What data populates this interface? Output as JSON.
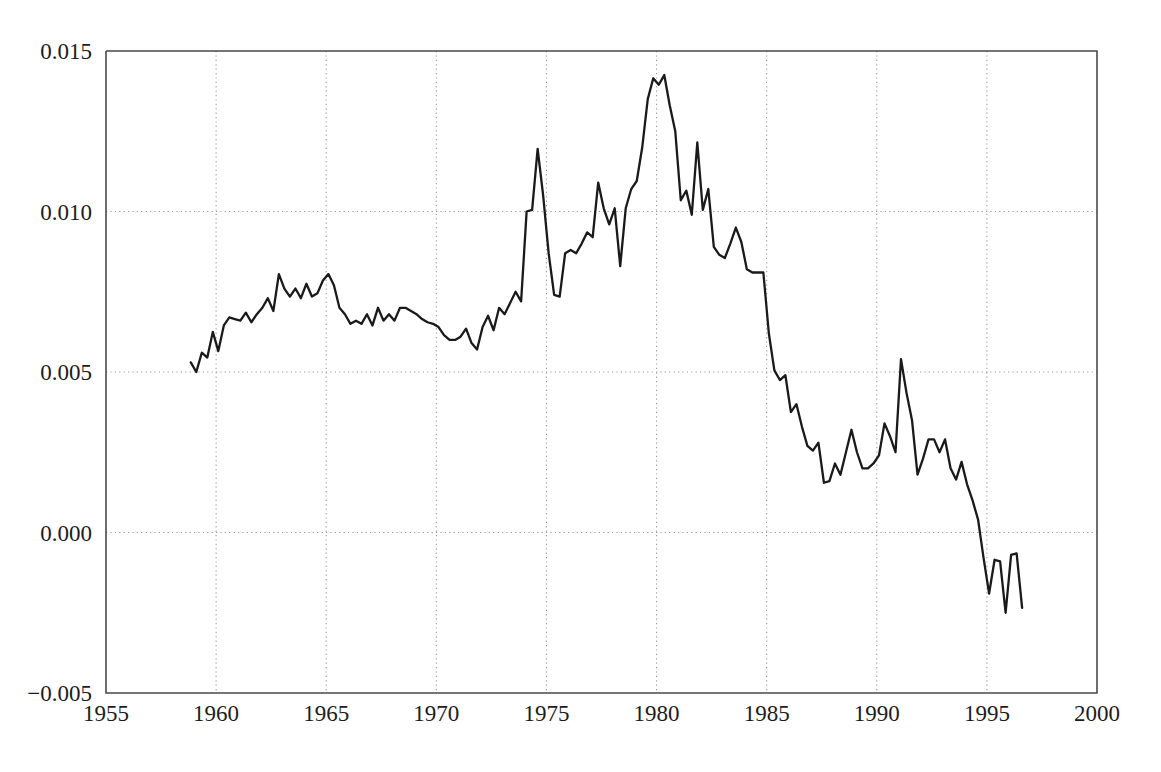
{
  "chart_data": {
    "type": "line",
    "title": "",
    "subtitle": "",
    "xlabel": "",
    "ylabel": "",
    "xlim": [
      1955,
      2000
    ],
    "ylim": [
      -0.005,
      0.015
    ],
    "xticks": [
      1955,
      1960,
      1965,
      1970,
      1975,
      1980,
      1985,
      1990,
      1995,
      2000
    ],
    "xtick_labels": [
      "1955",
      "1960",
      "1965",
      "1970",
      "1975",
      "1980",
      "1985",
      "1990",
      "1995",
      "2000"
    ],
    "yticks": [
      -0.005,
      0.0,
      0.005,
      0.01,
      0.015
    ],
    "ytick_labels": [
      "-0.005",
      "0.000",
      "0.005",
      "0.010",
      "0.015"
    ],
    "grid": true,
    "grid_style": "dotted",
    "legend": false,
    "legend_position": "none",
    "line_color": "#1a1a1a",
    "background_color": "#ffffff",
    "axis_color": "#4a4a4a",
    "grid_color": "#9a9a9a",
    "series": [
      {
        "name": "series-1",
        "x": [
          1958.85,
          1959.1,
          1959.35,
          1959.6,
          1959.85,
          1960.1,
          1960.35,
          1960.6,
          1960.85,
          1961.1,
          1961.35,
          1961.6,
          1961.85,
          1962.1,
          1962.35,
          1962.6,
          1962.85,
          1963.1,
          1963.35,
          1963.6,
          1963.85,
          1964.1,
          1964.35,
          1964.6,
          1964.85,
          1965.1,
          1965.35,
          1965.6,
          1965.85,
          1966.1,
          1966.35,
          1966.6,
          1966.85,
          1967.1,
          1967.35,
          1967.6,
          1967.85,
          1968.1,
          1968.35,
          1968.6,
          1968.85,
          1969.1,
          1969.35,
          1969.6,
          1969.85,
          1970.1,
          1970.35,
          1970.6,
          1970.85,
          1971.1,
          1971.35,
          1971.6,
          1971.85,
          1972.1,
          1972.35,
          1972.6,
          1972.85,
          1973.1,
          1973.35,
          1973.6,
          1973.85,
          1974.1,
          1974.35,
          1974.6,
          1974.85,
          1975.1,
          1975.35,
          1975.6,
          1975.85,
          1976.1,
          1976.35,
          1976.6,
          1976.85,
          1977.1,
          1977.35,
          1977.6,
          1977.85,
          1978.1,
          1978.35,
          1978.6,
          1978.85,
          1979.1,
          1979.35,
          1979.6,
          1979.85,
          1980.1,
          1980.35,
          1980.6,
          1980.85,
          1981.1,
          1981.35,
          1981.6,
          1981.85,
          1982.1,
          1982.35,
          1982.6,
          1982.85,
          1983.1,
          1983.35,
          1983.6,
          1983.85,
          1984.1,
          1984.35,
          1984.6,
          1984.85,
          1985.1,
          1985.35,
          1985.6,
          1985.85,
          1986.1,
          1986.35,
          1986.6,
          1986.85,
          1987.1,
          1987.35,
          1987.6,
          1987.85,
          1988.1,
          1988.35,
          1988.6,
          1988.85,
          1989.1,
          1989.35,
          1989.6,
          1989.85,
          1990.1,
          1990.35,
          1990.6,
          1990.85,
          1991.1,
          1991.35,
          1991.6,
          1991.85,
          1992.1,
          1992.35,
          1992.6,
          1992.85,
          1993.1,
          1993.35,
          1993.6,
          1993.85,
          1994.1,
          1994.35,
          1994.6,
          1994.85,
          1995.1,
          1995.35,
          1995.6,
          1995.85,
          1996.1,
          1996.35,
          1996.6
        ],
        "y": [
          0.0053,
          0.005,
          0.0056,
          0.00545,
          0.00625,
          0.00565,
          0.00645,
          0.0067,
          0.00665,
          0.0066,
          0.00685,
          0.00655,
          0.0068,
          0.007,
          0.0073,
          0.0069,
          0.00805,
          0.0076,
          0.00735,
          0.0076,
          0.0073,
          0.00775,
          0.00735,
          0.00745,
          0.00785,
          0.00805,
          0.0077,
          0.007,
          0.0068,
          0.0065,
          0.0066,
          0.0065,
          0.0068,
          0.00645,
          0.007,
          0.0066,
          0.0068,
          0.0066,
          0.007,
          0.007,
          0.0069,
          0.0068,
          0.00665,
          0.00655,
          0.0065,
          0.0064,
          0.00615,
          0.006,
          0.006,
          0.0061,
          0.00635,
          0.0059,
          0.0057,
          0.0064,
          0.00675,
          0.0063,
          0.007,
          0.0068,
          0.00715,
          0.0075,
          0.0072,
          0.01,
          0.01005,
          0.01195,
          0.0105,
          0.0087,
          0.0074,
          0.00735,
          0.0087,
          0.0088,
          0.0087,
          0.009,
          0.00935,
          0.0092,
          0.0109,
          0.0101,
          0.0096,
          0.0101,
          0.0083,
          0.0101,
          0.0107,
          0.01095,
          0.012,
          0.0135,
          0.01415,
          0.01395,
          0.01425,
          0.0133,
          0.0125,
          0.01035,
          0.01065,
          0.0099,
          0.01215,
          0.01005,
          0.0107,
          0.0089,
          0.00865,
          0.00855,
          0.009,
          0.0095,
          0.00905,
          0.0082,
          0.0081,
          0.0081,
          0.0081,
          0.0062,
          0.00505,
          0.00475,
          0.0049,
          0.00375,
          0.004,
          0.0033,
          0.0027,
          0.00255,
          0.0028,
          0.00155,
          0.0016,
          0.00215,
          0.0018,
          0.0025,
          0.0032,
          0.0025,
          0.002,
          0.002,
          0.00215,
          0.0024,
          0.0034,
          0.003,
          0.0025,
          0.0054,
          0.00435,
          0.0035,
          0.0018,
          0.0023,
          0.0029,
          0.0029,
          0.0025,
          0.0029,
          0.002,
          0.00165,
          0.0022,
          0.0015,
          0.001,
          0.0004,
          -0.0008,
          -0.0019,
          -0.00085,
          -0.0009,
          -0.0025,
          -0.0007,
          -0.00065,
          -0.00235
        ]
      }
    ]
  },
  "plot_geometry": {
    "left": 106,
    "right": 1097,
    "top": 51,
    "bottom": 693
  }
}
